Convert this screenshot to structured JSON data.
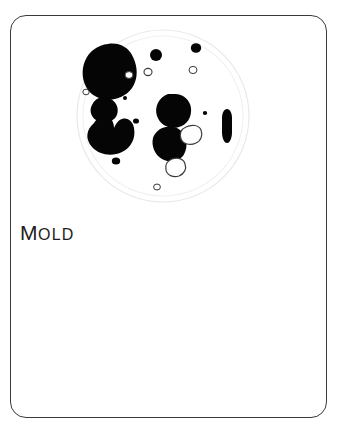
{
  "card": {
    "label": "MOLD",
    "label_first_letter": "M",
    "label_rest": "OLD",
    "border_color": "#3a3a3e",
    "background_color": "#ffffff",
    "text_color": "#1d1d20"
  },
  "illustration": {
    "name": "petri-dish-with-mold-colonies",
    "dish": {
      "outer_rim_color": "#e8e8ea",
      "inner_rim_color": "#f0f0f2",
      "fill_color": "#ffffff",
      "center_x": 89,
      "center_y": 88,
      "outer_radius": 86,
      "inner_radius": 80
    },
    "colony_fill_color": "#050505",
    "colony_outline_color": "#3a3a3e",
    "colony_count": 22,
    "colonies": [
      {
        "id": "colony-large-upper-left",
        "type": "filled",
        "cx": 37,
        "cy": 37,
        "rx": 24,
        "ry": 21
      },
      {
        "id": "colony-medium-left",
        "type": "filled",
        "cx": 28,
        "cy": 79,
        "rx": 12,
        "ry": 9
      },
      {
        "id": "colony-large-left-lobed",
        "type": "filled",
        "cx": 34,
        "cy": 104,
        "rx": 19,
        "ry": 16
      },
      {
        "id": "colony-medium-center",
        "type": "filled",
        "cx": 100,
        "cy": 80,
        "rx": 15,
        "ry": 14
      },
      {
        "id": "colony-medium-lower-center",
        "type": "filled",
        "cx": 96,
        "cy": 113,
        "rx": 15,
        "ry": 14
      },
      {
        "id": "colony-elongated-right",
        "type": "filled",
        "cx": 153,
        "cy": 96,
        "rx": 4,
        "ry": 15
      },
      {
        "id": "colony-small-top-mid",
        "type": "filled",
        "cx": 82,
        "cy": 27,
        "rx": 6,
        "ry": 6
      },
      {
        "id": "colony-small-top-right",
        "type": "filled",
        "cx": 122,
        "cy": 20,
        "rx": 5,
        "ry": 5
      },
      {
        "id": "colony-tiny-left-upper",
        "type": "filled",
        "cx": 51,
        "cy": 70,
        "rx": 2,
        "ry": 2
      },
      {
        "id": "colony-tiny-left-mid",
        "type": "filled",
        "cx": 62,
        "cy": 93,
        "rx": 3,
        "ry": 3
      },
      {
        "id": "colony-tiny-right-mid",
        "type": "filled",
        "cx": 131,
        "cy": 85,
        "rx": 2,
        "ry": 2
      },
      {
        "id": "colony-small-lower-left",
        "type": "filled",
        "cx": 42,
        "cy": 133,
        "rx": 4,
        "ry": 4
      },
      {
        "id": "colony-outline-upper-left",
        "type": "outline",
        "cx": 55,
        "cy": 47,
        "rx": 4,
        "ry": 4
      },
      {
        "id": "colony-outline-upper-mid",
        "type": "outline",
        "cx": 74,
        "cy": 44,
        "rx": 4,
        "ry": 4
      },
      {
        "id": "colony-outline-upper-right",
        "type": "outline",
        "cx": 119,
        "cy": 42,
        "rx": 4,
        "ry": 4
      },
      {
        "id": "colony-outline-far-left",
        "type": "outline",
        "cx": 12,
        "cy": 64,
        "rx": 3,
        "ry": 3
      },
      {
        "id": "colony-outline-mid-right",
        "type": "outline",
        "cx": 118,
        "cy": 105,
        "rx": 9,
        "ry": 8
      },
      {
        "id": "colony-outline-lower-mid",
        "type": "outline",
        "cx": 103,
        "cy": 137,
        "rx": 8,
        "ry": 7
      },
      {
        "id": "colony-outline-bottom",
        "type": "outline",
        "cx": 83,
        "cy": 159,
        "rx": 3,
        "ry": 3
      }
    ]
  }
}
